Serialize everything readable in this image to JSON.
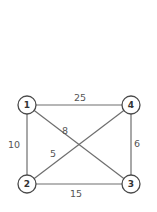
{
  "graph": {
    "nodes": [
      {
        "id": "1",
        "label": "1",
        "x": 27,
        "y": 105
      },
      {
        "id": "2",
        "label": "2",
        "x": 27,
        "y": 184
      },
      {
        "id": "3",
        "label": "3",
        "x": 131,
        "y": 184
      },
      {
        "id": "4",
        "label": "4",
        "x": 131,
        "y": 105
      }
    ],
    "edges": [
      {
        "from": "1",
        "to": "4",
        "weight": "25",
        "label_x": 80,
        "label_y": 97
      },
      {
        "from": "1",
        "to": "2",
        "weight": "10",
        "label_x": 14,
        "label_y": 144
      },
      {
        "from": "1",
        "to": "3",
        "weight": "8",
        "label_x": 65,
        "label_y": 130
      },
      {
        "from": "2",
        "to": "4",
        "weight": "5",
        "label_x": 53,
        "label_y": 153
      },
      {
        "from": "4",
        "to": "3",
        "weight": "6",
        "label_x": 137,
        "label_y": 143
      },
      {
        "from": "2",
        "to": "3",
        "weight": "15",
        "label_x": 76,
        "label_y": 193
      }
    ]
  },
  "colors": {
    "edge": "#6e6e6e",
    "node_stroke": "#4a4a4a",
    "text": "#555555",
    "background": "#ffffff"
  }
}
